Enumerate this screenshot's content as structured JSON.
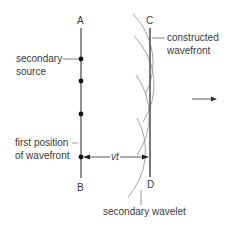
{
  "diagram": {
    "points": {
      "A": "A",
      "B": "B",
      "C": "C",
      "D": "D"
    },
    "labels": {
      "secondary_source_line1": "secondary",
      "secondary_source_line2": "source",
      "first_position_line1": "first position",
      "first_position_line2": "of wavefront",
      "constructed_line1": "constructed",
      "constructed_line2": "wavefront",
      "secondary_wavelet": "secondary wavelet",
      "distance": "vt"
    },
    "colors": {
      "line": "#555555",
      "arc": "#9a9a9a",
      "dot": "#111111",
      "text": "#3a3a3a"
    },
    "sources_y": [
      59,
      81,
      114,
      157
    ],
    "direction": "propagation-right"
  }
}
